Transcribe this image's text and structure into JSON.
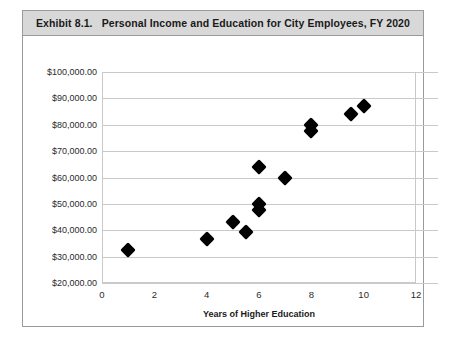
{
  "figure": {
    "exhibit_number": "Exhibit 8.1.",
    "title": "Personal Income and Education for City Employees, FY 2020"
  },
  "chart_data": {
    "type": "scatter",
    "xlabel": "Years of Higher Education",
    "ylabel": "",
    "xlim": [
      0,
      12
    ],
    "ylim": [
      20000,
      100000
    ],
    "grid": true,
    "legend": null,
    "xticks": [
      "0",
      "2",
      "4",
      "6",
      "8",
      "10",
      "12"
    ],
    "xtick_values": [
      0,
      2,
      4,
      6,
      8,
      10,
      12
    ],
    "yticks": [
      "$100,000.00",
      "$90,000.00",
      "$80,000.00",
      "$70,000.00",
      "$60,000.00",
      "$50,000.00",
      "$40,000.00",
      "$30,000.00",
      "$20,000.00"
    ],
    "ytick_values": [
      100000,
      90000,
      80000,
      70000,
      60000,
      50000,
      40000,
      30000,
      20000
    ],
    "marker": "diamond",
    "marker_color": "#000000",
    "points": [
      {
        "x": 1,
        "y": 32500
      },
      {
        "x": 4,
        "y": 36500
      },
      {
        "x": 5,
        "y": 43000
      },
      {
        "x": 5.5,
        "y": 39500
      },
      {
        "x": 6,
        "y": 47500
      },
      {
        "x": 6,
        "y": 50000
      },
      {
        "x": 6,
        "y": 64000
      },
      {
        "x": 7,
        "y": 60000
      },
      {
        "x": 8,
        "y": 80000
      },
      {
        "x": 8,
        "y": 77500
      },
      {
        "x": 9.5,
        "y": 84000
      },
      {
        "x": 10,
        "y": 87000
      }
    ]
  }
}
